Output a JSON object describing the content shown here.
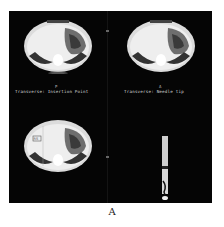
{
  "figure": {
    "caption": "A",
    "panels": [
      {
        "id": "top-left",
        "label": "Transverse: Insertion Point",
        "marker": "P",
        "view": "axial CT slice"
      },
      {
        "id": "top-right",
        "label": "Transverse: Needle tip",
        "marker": "A",
        "view": "axial CT slice"
      },
      {
        "id": "bottom-left",
        "label": "",
        "marker": "",
        "view": "axial CT slice with needle path",
        "inset_text": "RS"
      },
      {
        "id": "bottom-right",
        "label": "",
        "marker": "",
        "view": "needle-path sagittal strip"
      }
    ],
    "colors": {
      "background": "#050505",
      "tissue": "#e6e6e6",
      "page": "#ffffff"
    }
  }
}
